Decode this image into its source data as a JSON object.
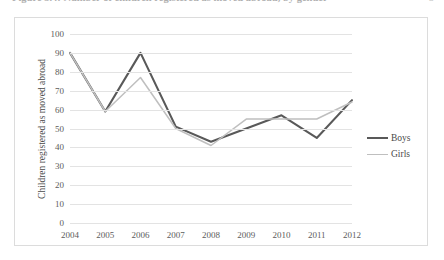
{
  "caption": {
    "text": "Figure 3.4:  Number of children registered as moved abroad, by gender",
    "page_marker": "5"
  },
  "chart_data": {
    "type": "line",
    "title": "",
    "xlabel": "",
    "ylabel": "Children registered as moved abroad",
    "categories": [
      "2004",
      "2005",
      "2006",
      "2007",
      "2008",
      "2009",
      "2010",
      "2011",
      "2012"
    ],
    "series": [
      {
        "name": "Boys",
        "color": "#595959",
        "width": 2.1,
        "values": [
          90,
          59,
          90,
          51,
          43,
          50,
          57,
          45,
          65
        ]
      },
      {
        "name": "Girls",
        "color": "#bfbfbf",
        "width": 1.5,
        "values": [
          90,
          59,
          77,
          50,
          41,
          55,
          55,
          55,
          64
        ]
      }
    ],
    "ylim": [
      0,
      100
    ],
    "yticks": [
      0,
      10,
      20,
      30,
      40,
      50,
      60,
      70,
      80,
      90,
      100
    ],
    "grid": "horizontal",
    "legend_position": "right"
  }
}
